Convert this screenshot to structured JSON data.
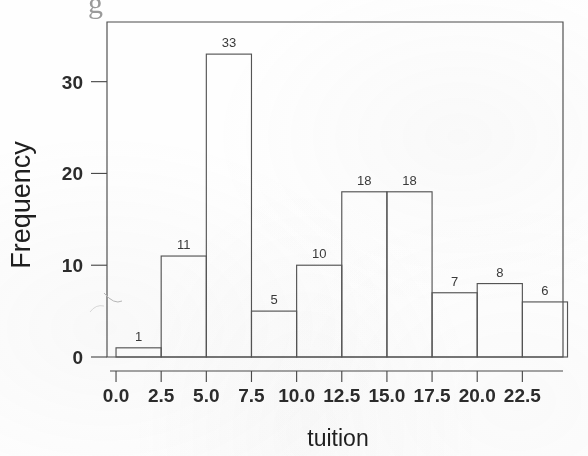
{
  "figure": {
    "kind": "histogram",
    "background_color": "#fefefe",
    "ink_color": "#4b4b4b",
    "top_artifact_glyph": "g"
  },
  "chart_data": {
    "type": "bar",
    "title": "",
    "xlabel": "tuition",
    "ylabel": "Frequency",
    "categories": [
      "0.0-2.5",
      "2.5-5.0",
      "5.0-7.5",
      "7.5-10.0",
      "10.0-12.5",
      "12.5-15.0",
      "15.0-17.5",
      "17.5-20.0",
      "20.0-22.5",
      "22.5-25.0"
    ],
    "bin_edges": [
      0.0,
      2.5,
      5.0,
      7.5,
      10.0,
      12.5,
      15.0,
      17.5,
      20.0,
      22.5,
      25.0
    ],
    "values": [
      1,
      11,
      33,
      5,
      10,
      18,
      18,
      7,
      8,
      6
    ],
    "bar_labels": [
      "1",
      "11",
      "33",
      "5",
      "10",
      "18",
      "18",
      "7",
      "8",
      "6"
    ],
    "xlim": [
      -0.5,
      24.75
    ],
    "ylim": [
      0,
      36.5
    ],
    "xticks": [
      0.0,
      2.5,
      5.0,
      7.5,
      10.0,
      12.5,
      15.0,
      17.5,
      20.0,
      22.5
    ],
    "xtick_labels": [
      "0.0",
      "2.5",
      "5.0",
      "7.5",
      "10.0",
      "12.5",
      "15.0",
      "17.5",
      "20.0",
      "22.5"
    ],
    "yticks": [
      0,
      10,
      20,
      30
    ],
    "ytick_labels": [
      "0",
      "10",
      "20",
      "30"
    ],
    "grid": false,
    "legend": false,
    "bar_fill": "none",
    "bar_edge_color": "#555555",
    "total_count": 117
  }
}
